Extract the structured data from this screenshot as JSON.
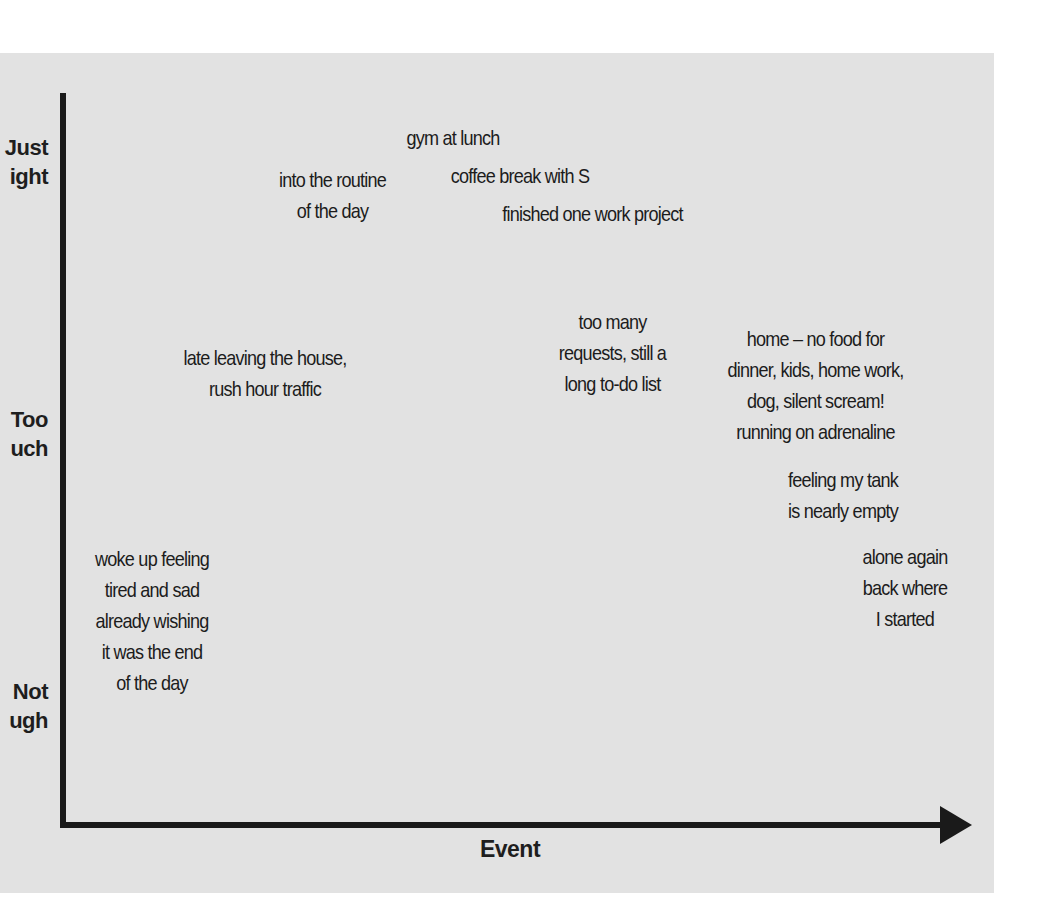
{
  "diagram": {
    "type": "emotional-journey-chart",
    "x_axis": {
      "label": "Event"
    },
    "y_axis": {
      "levels": [
        {
          "label_visible": "Just\night",
          "label_full": "Just Right"
        },
        {
          "label_visible": "Too\nuch",
          "label_full": "Too Much"
        },
        {
          "label_visible": "Not\nugh",
          "label_full": "Not Enough"
        }
      ]
    },
    "notes": [
      {
        "id": "woke-up",
        "text": "woke up feeling\ntired and sad\nalready wishing\nit was the end\nof the day",
        "level": "Not Enough"
      },
      {
        "id": "late-leaving",
        "text": "late leaving the house,\nrush hour traffic",
        "level": "Too Much"
      },
      {
        "id": "into-routine",
        "text": "into the routine\nof the day",
        "level": "Just Right"
      },
      {
        "id": "gym-lunch",
        "text": "gym at lunch",
        "level": "Just Right"
      },
      {
        "id": "coffee-break",
        "text": "coffee break with S",
        "level": "Just Right"
      },
      {
        "id": "finished-project",
        "text": "finished one work project",
        "level": "Just Right"
      },
      {
        "id": "too-many-requests",
        "text": "too many\nrequests, still a\nlong to-do list",
        "level": "Too Much"
      },
      {
        "id": "home-no-food",
        "text": "home – no food for\ndinner, kids, home work,\ndog, silent scream!\nrunning on adrenaline",
        "level": "Too Much"
      },
      {
        "id": "tank-empty",
        "text": "feeling my tank\nis nearly empty",
        "level": "Too Much"
      },
      {
        "id": "alone-again",
        "text": "alone again\nback where\nI started",
        "level": "Not Enough"
      }
    ]
  },
  "colors": {
    "panel_background": "#e2e2e2",
    "page_background": "#ffffff",
    "axis": "#1a1a1a",
    "text": "#1c1c1c"
  }
}
